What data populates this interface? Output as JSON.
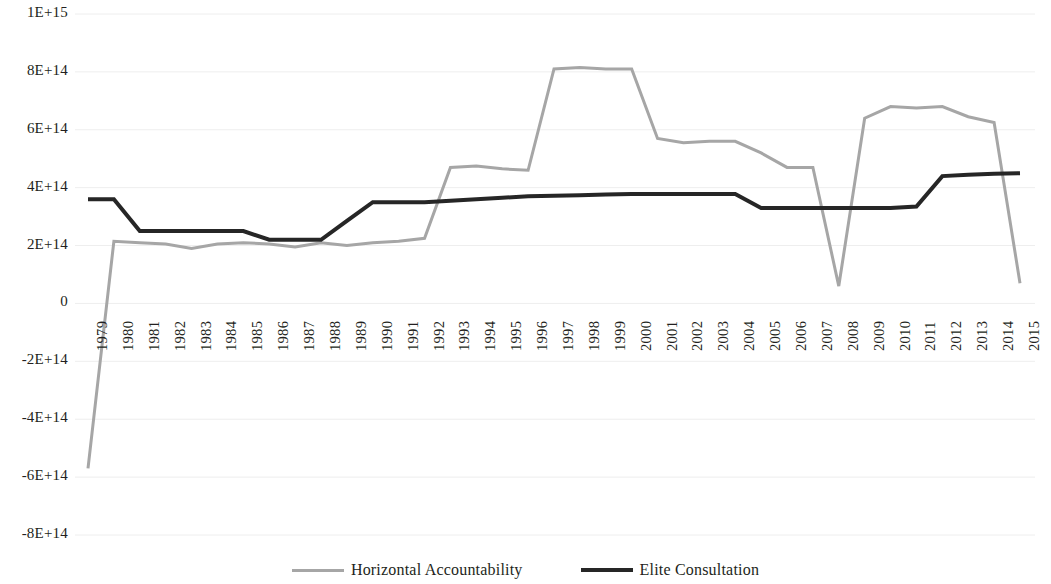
{
  "chart_data": {
    "type": "line",
    "title": "",
    "subtitle": "",
    "xlabel": "",
    "ylabel": "",
    "grid": true,
    "legend_position": "bottom",
    "xlim": [
      1979,
      2015
    ],
    "ylim": [
      -800000000000000.0,
      1000000000000000.0
    ],
    "ytick_labels": [
      "1E+15",
      "8E+14",
      "6E+14",
      "4E+14",
      "2E+14",
      "0",
      "-2E+14",
      "-4E+14",
      "-6E+14",
      "-8E+14"
    ],
    "ytick_values": [
      1000000000000000.0,
      800000000000000.0,
      600000000000000.0,
      400000000000000.0,
      200000000000000.0,
      0,
      -200000000000000.0,
      -400000000000000.0,
      -600000000000000.0,
      -800000000000000.0
    ],
    "categories": [
      "1979",
      "1980",
      "1981",
      "1982",
      "1983",
      "1984",
      "1985",
      "1986",
      "1987",
      "1988",
      "1989",
      "1990",
      "1991",
      "1992",
      "1993",
      "1994",
      "1995",
      "1996",
      "1997",
      "1998",
      "1999",
      "2000",
      "2001",
      "2002",
      "2003",
      "2004",
      "2005",
      "2006",
      "2007",
      "2008",
      "2009",
      "2010",
      "2011",
      "2012",
      "2013",
      "2014",
      "2015"
    ],
    "series": [
      {
        "name": "Horizontal Accountability",
        "color": "#a6a6a6",
        "width": 3,
        "values": [
          -570000000000000.0,
          215000000000000.0,
          210000000000000.0,
          205000000000000.0,
          190000000000000.0,
          205000000000000.0,
          210000000000000.0,
          205000000000000.0,
          195000000000000.0,
          210000000000000.0,
          200000000000000.0,
          210000000000000.0,
          215000000000000.0,
          225000000000000.0,
          470000000000000.0,
          475000000000000.0,
          465000000000000.0,
          460000000000000.0,
          810000000000000.0,
          815000000000000.0,
          810000000000000.0,
          810000000000000.0,
          570000000000000.0,
          555000000000000.0,
          560000000000000.0,
          560000000000000.0,
          520000000000000.0,
          470000000000000.0,
          470000000000000.0,
          60000000000000.0,
          640000000000000.0,
          680000000000000.0,
          675000000000000.0,
          680000000000000.0,
          645000000000000.0,
          625000000000000.0,
          70000000000000.0
        ]
      },
      {
        "name": "Elite Consultation",
        "color": "#262626",
        "width": 4,
        "values": [
          360000000000000.0,
          360000000000000.0,
          250000000000000.0,
          250000000000000.0,
          250000000000000.0,
          250000000000000.0,
          250000000000000.0,
          220000000000000.0,
          220000000000000.0,
          220000000000000.0,
          285000000000000.0,
          350000000000000.0,
          350000000000000.0,
          350000000000000.0,
          355000000000000.0,
          360000000000000.0,
          365000000000000.0,
          370000000000000.0,
          372000000000000.0,
          374000000000000.0,
          376000000000000.0,
          378000000000000.0,
          378000000000000.0,
          378000000000000.0,
          378000000000000.0,
          378000000000000.0,
          330000000000000.0,
          330000000000000.0,
          330000000000000.0,
          330000000000000.0,
          330000000000000.0,
          330000000000000.0,
          335000000000000.0,
          440000000000000.0,
          445000000000000.0,
          448000000000000.0,
          450000000000000.0
        ]
      }
    ]
  },
  "legend": {
    "items": [
      {
        "label": "Horizontal Accountability",
        "swatch": "gray-line-swatch"
      },
      {
        "label": "Elite Consultation",
        "swatch": "dark-line-swatch"
      }
    ]
  }
}
